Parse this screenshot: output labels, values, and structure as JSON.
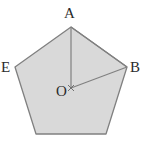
{
  "figure": {
    "title": "",
    "type": "geometry-diagram",
    "shape_name": "regular-pentagon",
    "background_color": "#ffffff",
    "fill_color": "#d9d9d9",
    "stroke_color": "#808080",
    "label_color": "#2b2b2b",
    "stroke_width": 1.2,
    "canvas": {
      "width": 143,
      "height": 142
    },
    "labels": {
      "A": "A",
      "B": "B",
      "E": "E",
      "O": "O"
    },
    "points": {
      "A": {
        "x": 71,
        "y": 27
      },
      "B": {
        "x": 127,
        "y": 67
      },
      "C": {
        "x": 106,
        "y": 134
      },
      "D": {
        "x": 36,
        "y": 134
      },
      "E": {
        "x": 15,
        "y": 67
      },
      "O": {
        "x": 71,
        "y": 88
      }
    },
    "polygon_points": "71,27 127,67 106,134 36,134 15,67",
    "segments": [
      {
        "name": "radius-OA",
        "from": "O",
        "to": "A"
      },
      {
        "name": "radius-OB",
        "from": "O",
        "to": "B"
      },
      {
        "name": "chord-AB",
        "from": "A",
        "to": "B"
      }
    ],
    "center_marker": {
      "x": 71,
      "y": 88
    }
  }
}
